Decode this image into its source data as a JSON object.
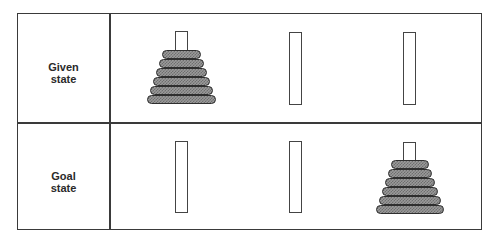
{
  "diagram": {
    "type": "tower-of-hanoi-states",
    "rows": [
      {
        "id": "given",
        "label_lines": [
          "Given",
          "state"
        ],
        "pegs": [
          {
            "index": 1,
            "disks": 6
          },
          {
            "index": 2,
            "disks": 0
          },
          {
            "index": 3,
            "disks": 0
          }
        ]
      },
      {
        "id": "goal",
        "label_lines": [
          "Goal",
          "state"
        ],
        "pegs": [
          {
            "index": 1,
            "disks": 0
          },
          {
            "index": 2,
            "disks": 0
          },
          {
            "index": 3,
            "disks": 6
          }
        ]
      }
    ],
    "colors": {
      "border": "#3a3a3a",
      "disk_fill": "#9a9a9a",
      "disk_pattern": "#6e6e6e",
      "disk_outline": "#2e2e2e",
      "background": "#ffffff"
    }
  }
}
